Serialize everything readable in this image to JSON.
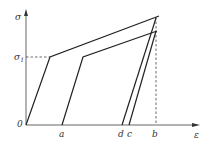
{
  "diagram": {
    "axes": {
      "y_label": "σ",
      "x_label": "ε",
      "origin_label": "0"
    },
    "stress_level": {
      "label": "σ",
      "subscript": "1"
    },
    "x_points": {
      "a": "a",
      "d": "d",
      "c": "c",
      "b": "b"
    },
    "colors": {
      "line": "#222222",
      "axis": "#555555",
      "dashed": "#444444"
    }
  }
}
